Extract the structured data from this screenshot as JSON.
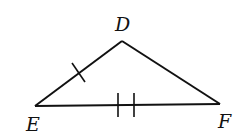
{
  "diagram": {
    "type": "triangle",
    "stroke_color": "#111111",
    "background": "#ffffff",
    "vertices": {
      "D": {
        "label": "D",
        "x": 122,
        "y": 41
      },
      "E": {
        "label": "E",
        "x": 35,
        "y": 106
      },
      "F": {
        "label": "F",
        "x": 220,
        "y": 104
      }
    },
    "sides": [
      {
        "name": "DE",
        "tick_marks": 1
      },
      {
        "name": "EF",
        "tick_marks": 2
      },
      {
        "name": "DF",
        "tick_marks": 0
      }
    ]
  }
}
